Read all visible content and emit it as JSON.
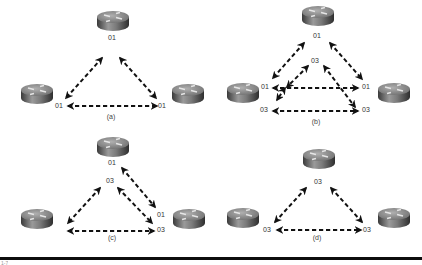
{
  "figure": {
    "bottom_caption": "1-7",
    "colors": {
      "arrow": "#111111",
      "label": "#333333",
      "router_top": "#8a8a8a",
      "router_side_dark": "#3a3a3a",
      "router_side_light": "#9a9a9a",
      "rule": "#0d0d0d"
    },
    "panels": [
      {
        "id": "a",
        "caption": "(a)",
        "caption_pos": [
          111,
          119
        ],
        "routers": [
          {
            "name": "top",
            "x": 96,
            "y": 10
          },
          {
            "name": "left",
            "x": 20,
            "y": 83
          },
          {
            "name": "right",
            "x": 171,
            "y": 83
          }
        ],
        "labels": [
          {
            "text": "01",
            "x": 112,
            "y": 40
          },
          {
            "text": "01",
            "x": 59,
            "y": 108
          },
          {
            "text": "01",
            "x": 162,
            "y": 108
          }
        ],
        "links": [
          {
            "from": [
              102,
              58
            ],
            "to": [
              66,
              98
            ]
          },
          {
            "from": [
              120,
              58
            ],
            "to": [
              156,
              98
            ]
          },
          {
            "from": [
              68,
              106
            ],
            "to": [
              157,
              106
            ]
          }
        ]
      },
      {
        "id": "b",
        "caption": "(b)",
        "caption_pos": [
          316,
          124
        ],
        "routers": [
          {
            "name": "top",
            "x": 301,
            "y": 5
          },
          {
            "name": "left",
            "x": 226,
            "y": 82
          },
          {
            "name": "right",
            "x": 377,
            "y": 82
          }
        ],
        "labels": [
          {
            "text": "01",
            "x": 317,
            "y": 38
          },
          {
            "text": "03",
            "x": 315,
            "y": 63
          },
          {
            "text": "01",
            "x": 265,
            "y": 89
          },
          {
            "text": "03",
            "x": 264,
            "y": 112
          },
          {
            "text": "01",
            "x": 366,
            "y": 89
          },
          {
            "text": "03",
            "x": 366,
            "y": 112
          }
        ],
        "links": [
          {
            "from": [
              304,
              43
            ],
            "to": [
              273,
              78
            ]
          },
          {
            "from": [
              330,
              43
            ],
            "to": [
              362,
              79
            ]
          },
          {
            "from": [
              308,
              66
            ],
            "to": [
              287,
              87
            ]
          },
          {
            "from": [
              324,
              66
            ],
            "to": [
              355,
              107
            ]
          },
          {
            "from": [
              285,
              88
            ],
            "to": [
              277,
              100
            ]
          },
          {
            "from": [
              273,
              88
            ],
            "to": [
              358,
              88
            ]
          },
          {
            "from": [
              273,
              111
            ],
            "to": [
              358,
              111
            ]
          }
        ]
      },
      {
        "id": "c",
        "caption": "(c)",
        "caption_pos": [
          112,
          240
        ],
        "routers": [
          {
            "name": "top",
            "x": 96,
            "y": 136
          },
          {
            "name": "left",
            "x": 20,
            "y": 208
          },
          {
            "name": "right",
            "x": 172,
            "y": 208
          }
        ],
        "labels": [
          {
            "text": "01",
            "x": 112,
            "y": 165
          },
          {
            "text": "03",
            "x": 110,
            "y": 183
          },
          {
            "text": "01",
            "x": 161,
            "y": 217
          },
          {
            "text": "03",
            "x": 161,
            "y": 232
          }
        ],
        "links": [
          {
            "from": [
              100,
              188
            ],
            "to": [
              68,
              223
            ]
          },
          {
            "from": [
              122,
              168
            ],
            "to": [
              155,
              207
            ]
          },
          {
            "from": [
              118,
              188
            ],
            "to": [
              152,
              223
            ]
          },
          {
            "from": [
              68,
              231
            ],
            "to": [
              154,
              231
            ]
          }
        ]
      },
      {
        "id": "d",
        "caption": "(d)",
        "caption_pos": [
          317,
          240
        ],
        "routers": [
          {
            "name": "top",
            "x": 302,
            "y": 148
          },
          {
            "name": "left",
            "x": 226,
            "y": 207
          },
          {
            "name": "right",
            "x": 377,
            "y": 207
          }
        ],
        "labels": [
          {
            "text": "03",
            "x": 318,
            "y": 184
          },
          {
            "text": "03",
            "x": 267,
            "y": 232
          },
          {
            "text": "03",
            "x": 367,
            "y": 232
          }
        ],
        "links": [
          {
            "from": [
              306,
              188
            ],
            "to": [
              275,
              222
            ]
          },
          {
            "from": [
              331,
              188
            ],
            "to": [
              362,
              222
            ]
          },
          {
            "from": [
              277,
              230
            ],
            "to": [
              361,
              230
            ]
          }
        ]
      }
    ]
  }
}
